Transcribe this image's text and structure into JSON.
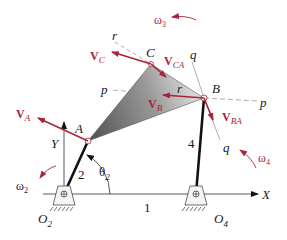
{
  "diagram": {
    "type": "four-bar linkage velocity diagram",
    "points": {
      "A": "A",
      "B": "B",
      "C": "C",
      "O2": "O",
      "O2_sub": "2",
      "O4": "O",
      "O4_sub": "4"
    },
    "links": {
      "ground": "1",
      "crank": "2",
      "rocker": "4"
    },
    "axes": {
      "x": "X",
      "y": "Y"
    },
    "angle": {
      "symbol": "θ",
      "sub": "2"
    },
    "lines": {
      "p1": "p",
      "p2": "p",
      "q1": "q",
      "q2": "q",
      "r1": "r",
      "r2": "r"
    },
    "velocities": {
      "VA": {
        "main": "V",
        "sub": "A"
      },
      "VB": {
        "main": "V",
        "sub": "B"
      },
      "VC": {
        "main": "V",
        "sub": "C"
      },
      "VCA": {
        "main": "V",
        "sub": "CA"
      },
      "VBA": {
        "main": "V",
        "sub": "BA"
      }
    },
    "angular_velocities": {
      "w2": {
        "main": "ω",
        "sub": "2"
      },
      "w3": {
        "main": "ω",
        "sub": "3"
      },
      "w4": {
        "main": "ω",
        "sub": "4"
      }
    },
    "colors": {
      "vector": "#a8243a",
      "link": "#111111",
      "line": "#999999",
      "plate_dark": "#5a5a5a",
      "plate_light": "#d8d8d8"
    }
  }
}
